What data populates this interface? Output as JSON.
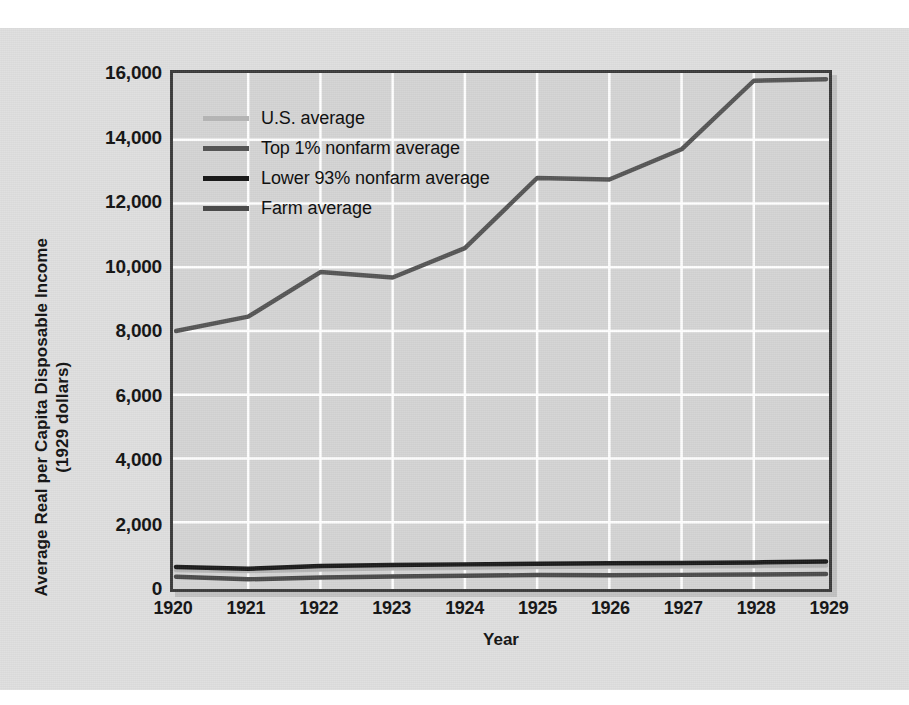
{
  "page": {
    "bleed_text_left": "",
    "bleed_text_right": ""
  },
  "chart_data": {
    "type": "line",
    "title": "",
    "xlabel": "Year",
    "ylabel": "Average Real per Capita Disposable Income\n(1929 dollars)",
    "ylabel_line1": "Average Real per Capita Disposable Income",
    "ylabel_line2": "(1929 dollars)",
    "categories": [
      "1920",
      "1921",
      "1922",
      "1923",
      "1924",
      "1925",
      "1926",
      "1927",
      "1928",
      "1929"
    ],
    "x": [
      1920,
      1921,
      1922,
      1923,
      1924,
      1925,
      1926,
      1927,
      1928,
      1929
    ],
    "xlim": [
      1920,
      1929
    ],
    "ylim": [
      0,
      16000
    ],
    "ytick_values": [
      0,
      2000,
      4000,
      6000,
      8000,
      10000,
      12000,
      14000,
      16000
    ],
    "ytick_labels": [
      "0",
      "2,000",
      "4,000",
      "6,000",
      "8,000",
      "10,000",
      "12,000",
      "14,000",
      "16,000"
    ],
    "grid": "both-white",
    "legend_position": "upper-left-inside",
    "series": [
      {
        "name": "U.S. average",
        "color": "#b4b4b4",
        "values": [
          500,
          470,
          520,
          560,
          575,
          600,
          615,
          620,
          630,
          645
        ]
      },
      {
        "name": "Top 1% nonfarm average",
        "color": "#555555",
        "values": [
          8000,
          8450,
          9850,
          9680,
          10600,
          12800,
          12750,
          13700,
          15850,
          15900
        ]
      },
      {
        "name": "Lower 93% nonfarm average",
        "color": "#1a1a1a",
        "values": [
          600,
          540,
          630,
          660,
          680,
          700,
          715,
          725,
          740,
          770
        ]
      },
      {
        "name": "Farm average",
        "color": "#4a4a4a",
        "values": [
          290,
          210,
          270,
          300,
          320,
          345,
          340,
          350,
          360,
          375
        ]
      }
    ]
  }
}
